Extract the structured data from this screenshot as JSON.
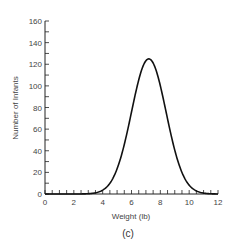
{
  "chart_data": {
    "type": "line",
    "title": "",
    "caption": "(c)",
    "xlabel": "Weight (lb)",
    "ylabel": "Number of Infants",
    "xlim": [
      0,
      12
    ],
    "ylim": [
      0,
      160
    ],
    "xticks": [
      "0",
      "2",
      "4",
      "6",
      "8",
      "10",
      "12"
    ],
    "yticks": [
      "0",
      "20",
      "40",
      "60",
      "80",
      "100",
      "120",
      "140",
      "160"
    ],
    "grid": false,
    "legend": null,
    "series": [
      {
        "name": "distribution",
        "distribution": "normal",
        "mean": 7.2,
        "sd": 1.2,
        "peak": 125,
        "x": [
          0,
          2,
          3,
          3.5,
          4,
          4.5,
          5,
          5.5,
          6,
          6.5,
          7,
          7.2,
          7.5,
          8,
          8.5,
          9,
          9.5,
          10,
          10.5,
          11,
          12
        ],
        "y": [
          0,
          0,
          1,
          2,
          4,
          10,
          23,
          45,
          75,
          105,
          122,
          125,
          122,
          100,
          70,
          41,
          20,
          8,
          3,
          1,
          0
        ]
      }
    ]
  }
}
